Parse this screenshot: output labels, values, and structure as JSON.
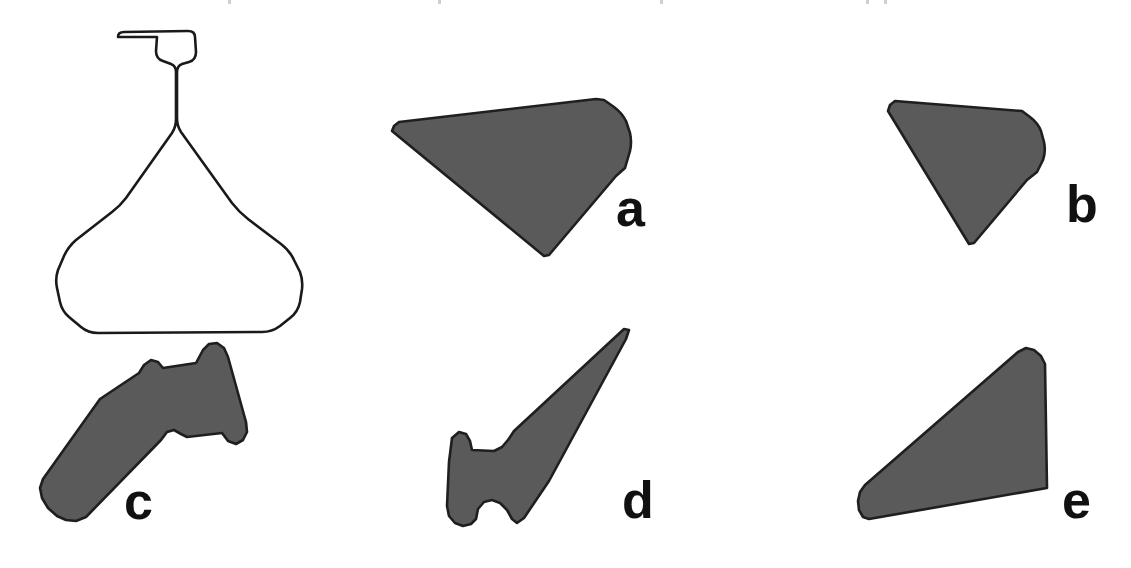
{
  "figure": {
    "background_color": "#ffffff",
    "outline_color": "#1a1a1a",
    "fill_color": "#5a5a5a",
    "label_color": "#111111",
    "width": 1131,
    "height": 568,
    "rows": 2,
    "columns": 3
  },
  "shapes": [
    {
      "id": "flask",
      "label": "",
      "style": "outline",
      "description": "erlenmeyer-flask-outline",
      "row": 1,
      "column": 1
    },
    {
      "id": "a",
      "label": "a",
      "style": "filled",
      "description": "wedge-silhouette-rounded-right-edge",
      "row": 1,
      "column": 2
    },
    {
      "id": "b",
      "label": "b",
      "style": "filled",
      "description": "narrow-wedge-silhouette-rounded-right-edge",
      "row": 1,
      "column": 3
    },
    {
      "id": "c",
      "label": "c",
      "style": "filled",
      "description": "hockey-stick-silhouette",
      "row": 2,
      "column": 1
    },
    {
      "id": "d",
      "label": "d",
      "style": "filled",
      "description": "barbed-spike-silhouette",
      "row": 2,
      "column": 2
    },
    {
      "id": "e",
      "label": "e",
      "style": "filled",
      "description": "triangular-wedge-silhouette",
      "row": 2,
      "column": 3
    }
  ],
  "labels": {
    "a": "a",
    "b": "b",
    "c": "c",
    "d": "d",
    "e": "e"
  },
  "trim_marks": [
    {
      "x": 228
    },
    {
      "x": 438
    },
    {
      "x": 660
    },
    {
      "x": 866
    },
    {
      "x": 884
    }
  ]
}
